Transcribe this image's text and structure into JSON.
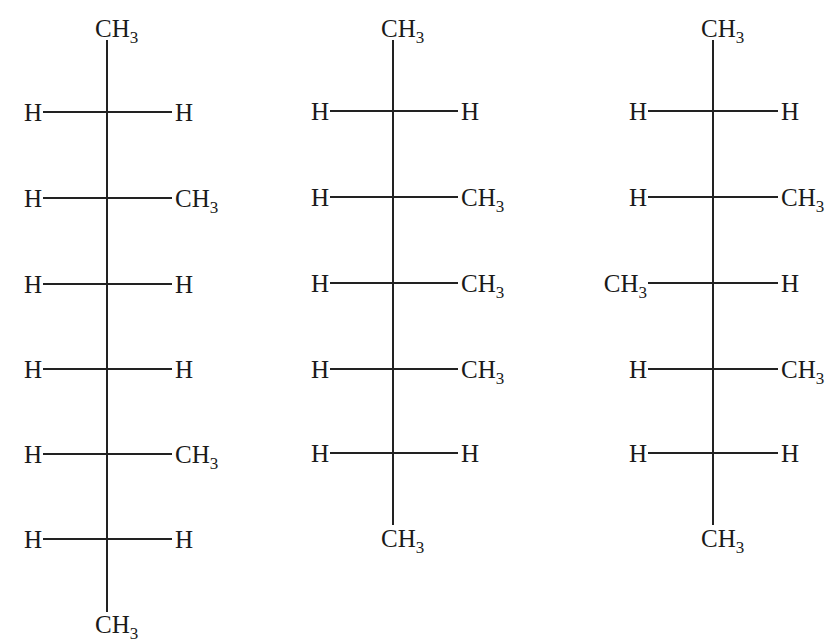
{
  "figure": {
    "type": "fischer-projections",
    "structures": [
      {
        "id": "structure-1",
        "top": "CH3",
        "bottom": "CH3",
        "rows": [
          {
            "left": "H",
            "right": "H"
          },
          {
            "left": "H",
            "right": "CH3"
          },
          {
            "left": "H",
            "right": "H"
          },
          {
            "left": "H",
            "right": "H"
          },
          {
            "left": "H",
            "right": "CH3"
          },
          {
            "left": "H",
            "right": "H"
          }
        ]
      },
      {
        "id": "structure-2",
        "top": "CH3",
        "bottom": "CH3",
        "rows": [
          {
            "left": "H",
            "right": "H"
          },
          {
            "left": "H",
            "right": "CH3"
          },
          {
            "left": "H",
            "right": "CH3"
          },
          {
            "left": "H",
            "right": "CH3"
          },
          {
            "left": "H",
            "right": "H"
          }
        ]
      },
      {
        "id": "structure-3",
        "top": "CH3",
        "bottom": "CH3",
        "rows": [
          {
            "left": "H",
            "right": "H"
          },
          {
            "left": "H",
            "right": "CH3"
          },
          {
            "left": "CH3",
            "right": "H"
          },
          {
            "left": "H",
            "right": "CH3"
          },
          {
            "left": "H",
            "right": "H"
          }
        ]
      }
    ]
  },
  "layout": {
    "structures": [
      {
        "cx": 107,
        "vTop": 40,
        "vBottom": 612,
        "rowYs": [
          112,
          198,
          284,
          369,
          454,
          539
        ],
        "hLeft": 43,
        "hRight": 172,
        "topY": 16,
        "bottomY": 612
      },
      {
        "cx": 393,
        "vTop": 40,
        "vBottom": 525,
        "rowYs": [
          111,
          197,
          283,
          369,
          453
        ],
        "hLeft": 330,
        "hRight": 458,
        "topY": 16,
        "bottomY": 526
      },
      {
        "cx": 713,
        "vTop": 40,
        "vBottom": 525,
        "rowYs": [
          111,
          197,
          283,
          369,
          453
        ],
        "hLeft": 648,
        "hRight": 778,
        "topY": 16,
        "bottomY": 526
      }
    ]
  }
}
